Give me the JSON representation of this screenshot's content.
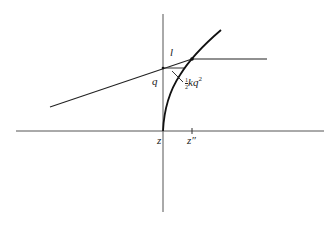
{
  "diagram": {
    "labels": {
      "l": "l",
      "q": "q",
      "z": "z",
      "z_double_prime": "z″",
      "annotation": {
        "frac_num": "1",
        "frac_den": "2",
        "body": "kq",
        "exponent": "2"
      }
    },
    "colors": {
      "line": "#222222",
      "axis": "#555555",
      "background": "#ffffff"
    }
  }
}
